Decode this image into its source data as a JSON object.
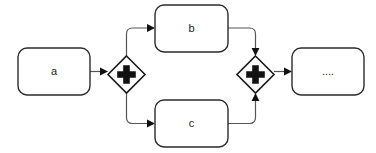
{
  "diagram": {
    "type": "bpmn-process",
    "notation": "BPMN parallel split and join",
    "canvas": {
      "width": 376,
      "height": 153,
      "background": "#ffffff"
    },
    "colors": {
      "shape_stroke": "#2b2b2b",
      "shape_fill": "#ffffff",
      "gateway_stroke": "#1a1a1a",
      "gateway_marker": "#111111",
      "flow_stroke": "#555555",
      "arrowhead": "#111111",
      "label_text": "#1a1a1a"
    },
    "nodes": [
      {
        "id": "task-a",
        "kind": "task",
        "label": "a",
        "shape": "rounded-rectangle",
        "x": 18,
        "y": 48,
        "width": 72,
        "height": 47
      },
      {
        "id": "gateway-split",
        "kind": "parallel-gateway",
        "label": "",
        "marker": "plus",
        "shape": "diamond",
        "x": 108,
        "y": 56,
        "width": 37,
        "height": 37
      },
      {
        "id": "task-b",
        "kind": "task",
        "label": "b",
        "shape": "rounded-rectangle",
        "x": 155,
        "y": 5,
        "width": 73,
        "height": 47
      },
      {
        "id": "task-c",
        "kind": "task",
        "label": "c",
        "shape": "rounded-rectangle",
        "x": 155,
        "y": 100,
        "width": 73,
        "height": 47
      },
      {
        "id": "gateway-join",
        "kind": "parallel-gateway",
        "label": "",
        "marker": "plus",
        "shape": "diamond",
        "x": 237,
        "y": 56,
        "width": 37,
        "height": 37
      },
      {
        "id": "task-next",
        "kind": "task",
        "label": "....",
        "shape": "rounded-rectangle",
        "x": 292,
        "y": 48,
        "width": 72,
        "height": 47
      }
    ],
    "flows": [
      {
        "id": "flow-a-split",
        "from": "task-a",
        "to": "gateway-split",
        "style": "straight"
      },
      {
        "id": "flow-split-b",
        "from": "gateway-split",
        "to": "task-b",
        "style": "elbow-up"
      },
      {
        "id": "flow-split-c",
        "from": "gateway-split",
        "to": "task-c",
        "style": "elbow-down"
      },
      {
        "id": "flow-b-join",
        "from": "task-b",
        "to": "gateway-join",
        "style": "elbow-down"
      },
      {
        "id": "flow-c-join",
        "from": "task-c",
        "to": "gateway-join",
        "style": "elbow-up"
      },
      {
        "id": "flow-join-next",
        "from": "gateway-join",
        "to": "task-next",
        "style": "straight"
      }
    ]
  }
}
